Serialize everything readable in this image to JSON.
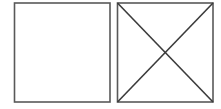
{
  "canvas": {
    "width": 221,
    "height": 109,
    "background_color": "#ffffff",
    "description": "Two adjacent outlined squares; the left square is empty, the right square contains an X formed by its two diagonals."
  },
  "style": {
    "square_stroke_color": "#595959",
    "square_stroke_width": 1.6,
    "diagonal_stroke_color": "#3b3b3b",
    "diagonal_stroke_width": 1.6,
    "fill_color": "#ffffff"
  },
  "figures": [
    {
      "id": "left-square",
      "name": "empty-square",
      "shape": "rectangle",
      "x": 14.5,
      "y": 3.0,
      "width": 95.5,
      "height": 99.0,
      "has_diagonals": false,
      "label": ""
    },
    {
      "id": "right-square",
      "name": "crossed-square",
      "shape": "rectangle",
      "x": 117.5,
      "y": 3.0,
      "width": 95.5,
      "height": 99.0,
      "has_diagonals": true,
      "label": ""
    }
  ],
  "diagonals": [
    {
      "id": "diagonal-tl-br",
      "name": "diagonal-top-left-to-bottom-right",
      "x1": 117.5,
      "y1": 3.0,
      "x2": 213.0,
      "y2": 102.0
    },
    {
      "id": "diagonal-tr-bl",
      "name": "diagonal-top-right-to-bottom-left",
      "x1": 213.0,
      "y1": 3.0,
      "x2": 117.5,
      "y2": 102.0
    }
  ],
  "intersection": {
    "name": "diagonal-intersection-point",
    "x": 165.25,
    "y": 52.5
  }
}
